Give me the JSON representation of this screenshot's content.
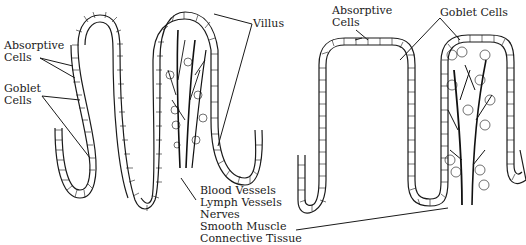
{
  "diagram": {
    "type": "anatomical illustration"
  },
  "labels": {
    "left_absorptive": "Absorptive\nCells",
    "left_goblet": "Goblet\nCells",
    "villus": "Villus",
    "core_structures": "Blood Vessels\nLymph Vessels\nNerves\nSmooth Muscle\nConnective Tissue",
    "right_absorptive": "Absorptive\nCells",
    "right_goblet": "Goblet Cells"
  },
  "colors": {
    "ink": "#1a1a1a",
    "background": "#ffffff"
  }
}
